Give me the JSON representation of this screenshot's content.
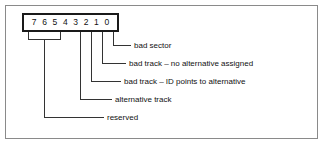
{
  "figure": {
    "colors": {
      "box_border": "#1a1a1a",
      "leader_line": "#333333",
      "frame_border": "#8a8a8a",
      "text": "#111111",
      "background": "#ffffff"
    }
  },
  "bit_box": {
    "name": "defect-status-byte",
    "bits": [
      {
        "label": "7"
      },
      {
        "label": "6"
      },
      {
        "label": "5"
      },
      {
        "label": "4"
      },
      {
        "label": "3"
      },
      {
        "label": "2"
      },
      {
        "label": "1"
      },
      {
        "label": "0"
      }
    ]
  },
  "callouts": [
    {
      "id": "bit0",
      "bits": "0",
      "label": "bad sector"
    },
    {
      "id": "bit1",
      "bits": "1",
      "label": "bad track – no alternative assigned"
    },
    {
      "id": "bit2",
      "bits": "2",
      "label": "bad track – ID points to alternative"
    },
    {
      "id": "bit3",
      "bits": "3",
      "label": "alternative track"
    },
    {
      "id": "bits7_4",
      "bits": "7-4",
      "label": "reserved"
    }
  ]
}
